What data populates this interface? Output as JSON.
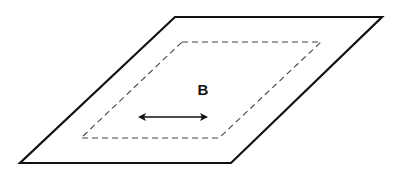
{
  "diagram": {
    "label": "B",
    "shapes": {
      "outer_plane": "solid parallelogram (plane/surface)",
      "inner_region": "dashed parallelogram",
      "arrow": "double-headed horizontal arrow"
    },
    "colors": {
      "stroke": "#111111",
      "dashed": "#444444",
      "background": "#ffffff"
    }
  }
}
